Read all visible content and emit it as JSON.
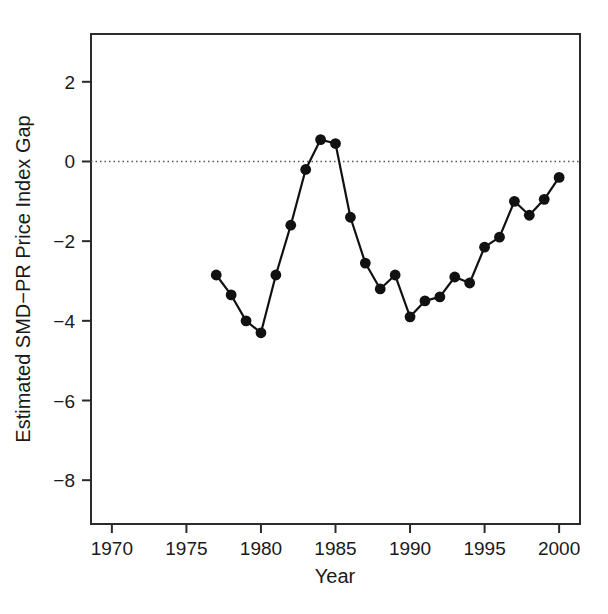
{
  "chart_data": {
    "type": "line",
    "title": "",
    "subtitle": "",
    "xlabel": "Year",
    "ylabel": "Estimated SMD−PR Price Index Gap",
    "xlim": [
      1968.6,
      2001.4
    ],
    "ylim": [
      -9.1,
      3.2
    ],
    "xticks": [
      1970,
      1975,
      1980,
      1985,
      1990,
      1995,
      2000
    ],
    "xticklabels": [
      "1970",
      "1975",
      "1980",
      "1985",
      "1990",
      "1995",
      "2000"
    ],
    "yticks": [
      2,
      0,
      -2,
      -4,
      -6,
      -8
    ],
    "yticklabels": [
      "2",
      "0",
      "−2",
      "−4",
      "−6",
      "−8"
    ],
    "grid": false,
    "legend": null,
    "legend_position": "none",
    "series": [
      {
        "name": "Estimated SMD−PR Price Index Gap",
        "marker": "filled-circle",
        "color": "#111111",
        "linewidth": 2.2,
        "x": [
          1977,
          1978,
          1979,
          1980,
          1981,
          1982,
          1983,
          1984,
          1985,
          1986,
          1987,
          1988,
          1989,
          1990,
          1991,
          1992,
          1993,
          1994,
          1995,
          1996,
          1997,
          1998,
          1999,
          2000
        ],
        "values": [
          -2.85,
          -3.35,
          -4.0,
          -4.3,
          -2.85,
          -1.6,
          -0.2,
          0.55,
          0.45,
          -1.4,
          -2.55,
          -3.2,
          -2.85,
          -3.9,
          -3.5,
          -3.4,
          -2.9,
          -3.05,
          -2.15,
          -1.9,
          -1.0,
          -1.35,
          -0.95,
          -0.4
        ]
      }
    ],
    "reference_lines": [
      {
        "name": "zero-line",
        "orientation": "horizontal",
        "value": 0,
        "style": "dotted",
        "color": "#555555"
      }
    ]
  }
}
